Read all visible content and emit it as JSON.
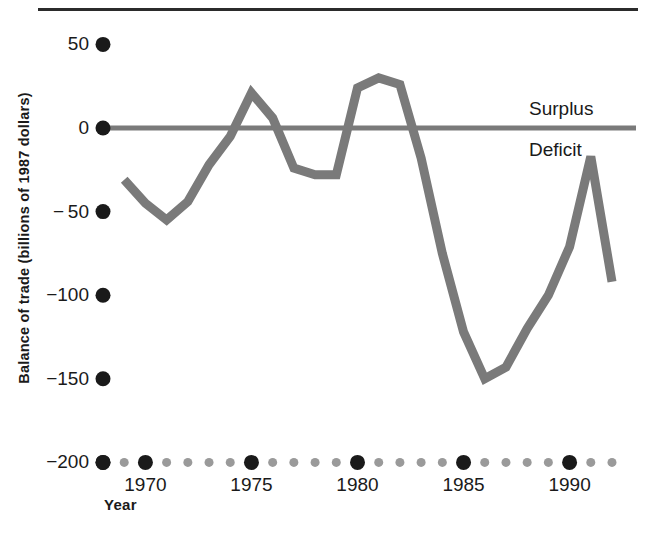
{
  "chart_data": {
    "type": "line",
    "title": "",
    "xlabel": "Year",
    "ylabel": "Balance of trade (billions of 1987 dollars)",
    "xlim": [
      1968,
      1992
    ],
    "ylim": [
      -200,
      50
    ],
    "grid": false,
    "legend_position": "none",
    "y_ticks": [
      50,
      0,
      -50,
      -100,
      -150,
      -200
    ],
    "y_tick_labels": [
      "50",
      "0",
      "− 50",
      "−100",
      "−150",
      "−200"
    ],
    "x_major_ticks": [
      1970,
      1975,
      1980,
      1985,
      1990
    ],
    "x_major_tick_labels": [
      "1970",
      "1975",
      "1980",
      "1985",
      "1990"
    ],
    "x_minor_ticks": [
      1968,
      1969,
      1971,
      1972,
      1973,
      1974,
      1976,
      1977,
      1978,
      1979,
      1981,
      1982,
      1983,
      1984,
      1986,
      1987,
      1988,
      1989,
      1991,
      1992
    ],
    "zero_line_value": 0,
    "annotations": [
      {
        "text": "Surplus",
        "x": 1991,
        "y": 18,
        "position": "above-zero-line"
      },
      {
        "text": "Deficit",
        "x": 1991,
        "y": -18,
        "position": "below-zero-line"
      }
    ],
    "series": [
      {
        "name": "Balance of trade",
        "color": "#7a7a7a",
        "x": [
          1969,
          1970,
          1971,
          1972,
          1973,
          1974,
          1975,
          1976,
          1977,
          1978,
          1979,
          1980,
          1981,
          1982,
          1983,
          1984,
          1985,
          1986,
          1987,
          1988,
          1989,
          1990,
          1991,
          1992
        ],
        "values": [
          -31,
          -45,
          -55,
          -44,
          -22,
          -5,
          21,
          6,
          -24,
          -28,
          -28,
          24,
          30,
          26,
          -18,
          -75,
          -122,
          -150,
          -143,
          -120,
          -100,
          -71,
          -17,
          -92
        ]
      }
    ]
  },
  "axis": {
    "y_title": "Balance of trade (billions of 1987 dollars)",
    "x_title": "Year"
  },
  "labels": {
    "surplus": "Surplus",
    "deficit": "Deficit"
  },
  "colors": {
    "line": "#7a7a7a",
    "zero_line": "#7a7a7a",
    "major_tick_dot": "#1a1a1a",
    "minor_tick_dot": "#9a9a9a",
    "rule": "#2b2b2b",
    "text": "#1a1a1a",
    "background": "#ffffff"
  }
}
